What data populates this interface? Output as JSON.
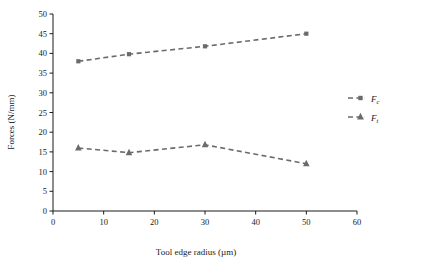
{
  "chart_data": {
    "type": "line",
    "title": "",
    "xlabel": "Tool edge radius (µm)",
    "ylabel": "Forces (N/mm)",
    "xlim": [
      0,
      60
    ],
    "ylim": [
      0,
      50
    ],
    "xticks": [
      0,
      10,
      20,
      30,
      40,
      50,
      60
    ],
    "yticks": [
      0,
      5,
      10,
      15,
      20,
      25,
      30,
      35,
      40,
      45,
      50
    ],
    "grid": false,
    "legend_position": "right",
    "x": [
      5,
      15,
      30,
      50
    ],
    "series": [
      {
        "name": "Fc",
        "label_base": "F",
        "label_sub": "c",
        "marker": "square",
        "color": "#6b6b6b",
        "values": [
          38.0,
          39.8,
          41.8,
          45.0
        ]
      },
      {
        "name": "Ft",
        "label_base": "F",
        "label_sub": "t",
        "marker": "triangle",
        "color": "#6b6b6b",
        "values": [
          16.0,
          14.8,
          16.8,
          12.0
        ]
      }
    ]
  },
  "axes": {
    "x_title": "Tool edge radius (µm)",
    "y_title": "Forces (N/mm)",
    "x_tick_labels": [
      "0",
      "10",
      "20",
      "30",
      "40",
      "50",
      "60"
    ],
    "y_tick_labels": [
      "0",
      "5",
      "10",
      "15",
      "20",
      "25",
      "30",
      "35",
      "40",
      "45",
      "50"
    ]
  },
  "legend": {
    "items": [
      {
        "base": "F",
        "sub": "c"
      },
      {
        "base": "F",
        "sub": "t"
      }
    ]
  },
  "colors": {
    "series": "#6b6b6b",
    "axis": "#1a1a1a",
    "background": "#ffffff"
  }
}
